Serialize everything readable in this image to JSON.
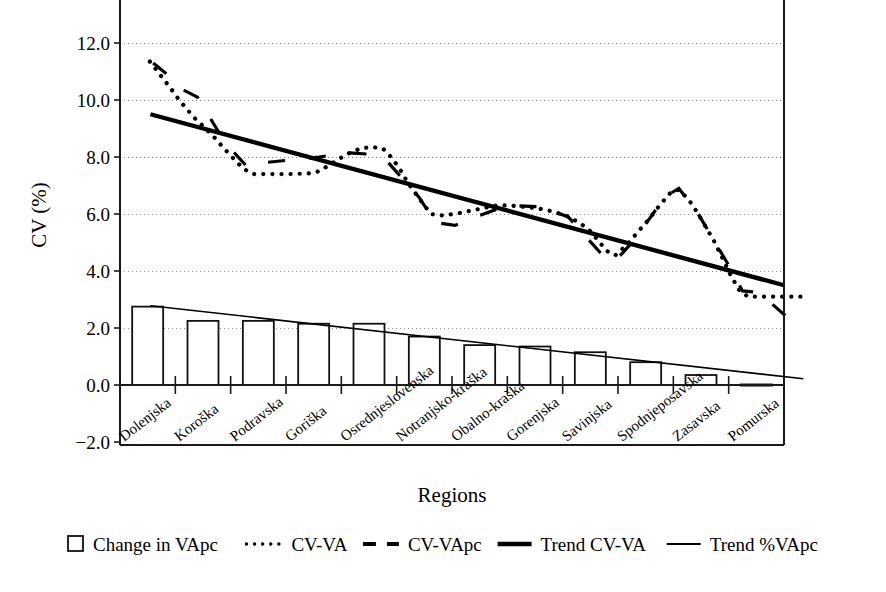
{
  "chart_data": {
    "type": "bar",
    "title": "",
    "xlabel": "Regions",
    "ylabel": "CV (%)",
    "ylim": [
      -2.0,
      13.0
    ],
    "yticks": [
      -2.0,
      0.0,
      2.0,
      4.0,
      6.0,
      8.0,
      10.0,
      12.0
    ],
    "ytick_labels": [
      "−2.0",
      "0.0",
      "2.0",
      "4.0",
      "6.0",
      "8.0",
      "10.0",
      "12.0"
    ],
    "grid": true,
    "legend_position": "bottom",
    "categories": [
      "Dolenjska",
      "Koroška",
      "Podravska",
      "Goriška",
      "Osrednjeslovenska",
      "Notranjsko-kraška",
      "Obalno-kraška",
      "Gorenjska",
      "Savinjska",
      "Spodnjeposavska",
      "Zasavska",
      "Pomurska"
    ],
    "series": [
      {
        "name": "Change in VApc",
        "style": "bar",
        "values": [
          2.75,
          2.25,
          2.25,
          2.15,
          2.15,
          1.7,
          1.4,
          1.35,
          1.15,
          0.8,
          0.35,
          0.02
        ]
      },
      {
        "name": "CV-VA",
        "style": "dotted",
        "values": [
          11.35,
          10.05,
          7.4,
          7.45,
          8.35,
          5.95,
          6.25,
          6.2,
          4.55,
          6.85,
          3.1,
          3.1
        ],
        "dense_points": [
          [
            0.04,
            11.35
          ],
          [
            0.12,
            11.15
          ],
          [
            0.2,
            10.95
          ],
          [
            0.3,
            10.7
          ],
          [
            0.42,
            10.4
          ],
          [
            0.55,
            10.05
          ],
          [
            0.72,
            9.65
          ],
          [
            0.88,
            9.3
          ],
          [
            1.02,
            9.05
          ],
          [
            1.2,
            8.7
          ],
          [
            1.38,
            8.3
          ],
          [
            1.55,
            7.95
          ],
          [
            1.72,
            7.6
          ],
          [
            1.9,
            7.4
          ],
          [
            2.1,
            7.4
          ],
          [
            2.5,
            7.4
          ],
          [
            2.9,
            7.42
          ],
          [
            3.1,
            7.5
          ],
          [
            3.35,
            7.8
          ],
          [
            3.6,
            8.1
          ],
          [
            3.85,
            8.3
          ],
          [
            4.05,
            8.35
          ],
          [
            4.25,
            8.3
          ],
          [
            4.4,
            8.0
          ],
          [
            4.55,
            7.6
          ],
          [
            4.7,
            7.1
          ],
          [
            4.85,
            6.7
          ],
          [
            5.0,
            6.3
          ],
          [
            5.12,
            6.0
          ],
          [
            5.3,
            5.95
          ],
          [
            5.55,
            6.0
          ],
          [
            5.8,
            6.1
          ],
          [
            6.05,
            6.2
          ],
          [
            6.3,
            6.3
          ],
          [
            6.55,
            6.3
          ],
          [
            6.8,
            6.25
          ],
          [
            7.05,
            6.2
          ],
          [
            7.3,
            6.1
          ],
          [
            7.55,
            5.95
          ],
          [
            7.8,
            5.7
          ],
          [
            8.0,
            5.4
          ],
          [
            8.15,
            5.05
          ],
          [
            8.3,
            4.7
          ],
          [
            8.45,
            4.55
          ],
          [
            8.65,
            4.9
          ],
          [
            8.85,
            5.35
          ],
          [
            9.05,
            5.8
          ],
          [
            9.25,
            6.3
          ],
          [
            9.45,
            6.75
          ],
          [
            9.6,
            6.85
          ],
          [
            9.78,
            6.5
          ],
          [
            9.95,
            6.0
          ],
          [
            10.1,
            5.5
          ],
          [
            10.25,
            5.0
          ],
          [
            10.4,
            4.4
          ],
          [
            10.55,
            3.8
          ],
          [
            10.7,
            3.3
          ],
          [
            10.85,
            3.1
          ],
          [
            11.1,
            3.1
          ],
          [
            11.4,
            3.1
          ],
          [
            11.7,
            3.1
          ],
          [
            11.95,
            3.1
          ]
        ]
      },
      {
        "name": "CV-VApc",
        "style": "dashed",
        "values": [
          11.3,
          10.1,
          7.7,
          8.0,
          8.1,
          5.65,
          6.3,
          6.25,
          4.35,
          6.9,
          3.2,
          2.15
        ],
        "dense_points": [
          [
            0.1,
            11.3
          ],
          [
            0.35,
            10.9
          ],
          [
            0.6,
            10.4
          ],
          [
            0.9,
            10.1
          ],
          [
            1.4,
            8.5
          ],
          [
            1.8,
            7.65
          ],
          [
            2.1,
            7.8
          ],
          [
            3.1,
            8.0
          ],
          [
            3.6,
            8.15
          ],
          [
            4.0,
            8.1
          ],
          [
            4.35,
            7.8
          ],
          [
            4.9,
            6.6
          ],
          [
            5.2,
            5.7
          ],
          [
            5.55,
            5.6
          ],
          [
            6.0,
            5.95
          ],
          [
            6.5,
            6.3
          ],
          [
            7.1,
            6.25
          ],
          [
            7.6,
            5.9
          ],
          [
            8.2,
            4.6
          ],
          [
            8.45,
            4.35
          ],
          [
            8.8,
            5.1
          ],
          [
            9.35,
            6.6
          ],
          [
            9.6,
            6.9
          ],
          [
            9.95,
            6.0
          ],
          [
            10.5,
            4.2
          ],
          [
            10.75,
            3.3
          ],
          [
            11.05,
            3.25
          ],
          [
            11.6,
            2.3
          ],
          [
            11.8,
            2.0
          ]
        ]
      },
      {
        "name": "Trend CV-VA",
        "style": "thick-solid",
        "endpoints": [
          [
            0.05,
            9.5
          ],
          [
            11.5,
            3.5
          ]
        ]
      },
      {
        "name": "Trend %VApc",
        "style": "thin-solid",
        "endpoints": [
          [
            0.05,
            2.78
          ],
          [
            11.85,
            0.22
          ]
        ]
      }
    ],
    "legend": [
      {
        "label": "Change in VApc",
        "marker": "open-square"
      },
      {
        "label": "CV-VA",
        "marker": "dotted-line"
      },
      {
        "label": "CV-VApc",
        "marker": "dashed-line"
      },
      {
        "label": "Trend CV-VA",
        "marker": "thick-solid-line"
      },
      {
        "label": "Trend %VApc",
        "marker": "thin-solid-line"
      }
    ]
  },
  "colors": {
    "ink": "#000000",
    "grid": "#8a8a8a",
    "paper": "#ffffff"
  }
}
